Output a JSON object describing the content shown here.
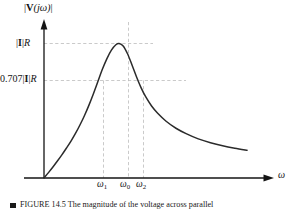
{
  "figure": {
    "kind": "resonance-magnitude-plot",
    "background_color": "#ffffff",
    "curve_color": "#2b2b2b",
    "axis_color": "#141414",
    "gridline_color": "#b9b9b9",
    "caption": "FIGURE 14.5 The magnitude of the voltage across parallel",
    "caption_number": "FIGURE 14.5"
  },
  "axes": {
    "y_title": "|V(jω)|",
    "y_title_parts": {
      "bar_open": "|",
      "vector": "V",
      "arg": "(jω)",
      "bar_close": "|"
    },
    "x_title": "ω",
    "y_ticks": [
      {
        "key": "peak",
        "label": "|I|R",
        "value_expr": "|I|R",
        "y_px": 44
      },
      {
        "key": "half",
        "label": "0.707|I|R",
        "value_expr": "0.707|I|R",
        "y_px": 80
      }
    ],
    "x_ticks": [
      {
        "key": "w1",
        "label": "ω",
        "sub": "1",
        "x_px": 103
      },
      {
        "key": "w0",
        "label": "ω",
        "sub": "0",
        "x_px": 128
      },
      {
        "key": "w2",
        "label": "ω",
        "sub": "2",
        "x_px": 143
      }
    ]
  },
  "chart_data": {
    "type": "line",
    "title": "",
    "xlabel": "ω",
    "ylabel": "|V(jω)|",
    "grid": true,
    "legend": "none",
    "xlim": [
      0,
      1
    ],
    "ylim": [
      0,
      1.08
    ],
    "annotations": [
      {
        "text": "|I|R",
        "type": "y-tick",
        "y": 1.0
      },
      {
        "text": "0.707|I|R",
        "type": "y-tick",
        "y": 0.707
      },
      {
        "text": "ω₁",
        "type": "x-tick",
        "x": 0.26
      },
      {
        "text": "ω₀",
        "type": "x-tick",
        "x": 0.37
      },
      {
        "text": "ω₂",
        "type": "x-tick",
        "x": 0.434
      }
    ],
    "series": [
      {
        "name": "|V(jω)| magnitude response",
        "x": [
          0.0,
          0.022,
          0.044,
          0.066,
          0.088,
          0.11,
          0.133,
          0.155,
          0.177,
          0.199,
          0.221,
          0.243,
          0.265,
          0.287,
          0.31,
          0.332,
          0.354,
          0.37,
          0.39,
          0.412,
          0.434,
          0.456,
          0.478,
          0.5,
          0.53,
          0.56,
          0.6,
          0.65,
          0.7,
          0.76,
          0.82,
          0.88,
          0.94,
          1.0
        ],
        "y": [
          0.0,
          0.04,
          0.082,
          0.126,
          0.172,
          0.221,
          0.274,
          0.331,
          0.394,
          0.463,
          0.54,
          0.625,
          0.715,
          0.806,
          0.888,
          0.951,
          0.991,
          1.0,
          0.982,
          0.922,
          0.838,
          0.751,
          0.672,
          0.606,
          0.535,
          0.481,
          0.424,
          0.37,
          0.33,
          0.291,
          0.262,
          0.239,
          0.221,
          0.206
        ]
      }
    ],
    "gridlines": {
      "horizontal": [
        {
          "y": 1.0,
          "label": "|I|R",
          "dashed": true
        },
        {
          "y": 0.707,
          "label": "0.707|I|R",
          "dashed": true
        }
      ],
      "vertical": [
        {
          "x": 0.26,
          "label": "ω₁",
          "dashed": true
        },
        {
          "x": 0.37,
          "label": "ω₀",
          "dashed": true
        },
        {
          "x": 0.434,
          "label": "ω₂",
          "dashed": true
        }
      ]
    }
  }
}
